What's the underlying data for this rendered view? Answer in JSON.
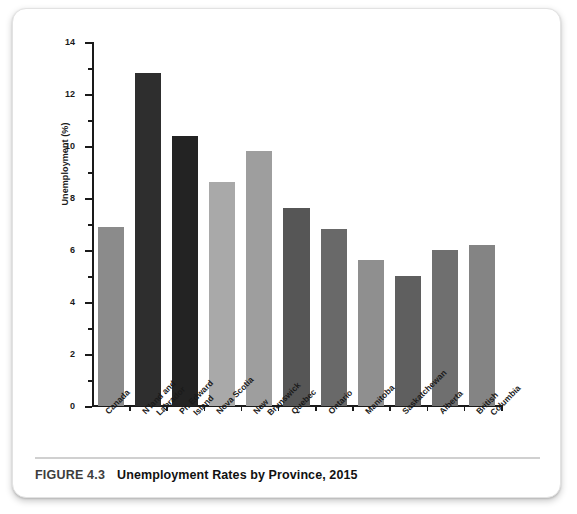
{
  "figure": {
    "caption_number": "FIGURE 4.3",
    "caption_title": "Unemployment Rates by Province, 2015"
  },
  "chart_data": {
    "type": "bar",
    "title": "Unemployment Rates by Province, 2015",
    "xlabel": "",
    "ylabel": "Unemployment (%)",
    "ylim": [
      0,
      14
    ],
    "y_ticks_major": [
      "0",
      "2",
      "4",
      "6",
      "8",
      "10",
      "12",
      "14"
    ],
    "y_ticks_minor": [
      1,
      3,
      5,
      7,
      9,
      11,
      13
    ],
    "grid": false,
    "legend": "none",
    "categories": [
      "Canada",
      "N'land and Labrador",
      "Pr. Edward Island",
      "Nova Scotia",
      "New Brunswick",
      "Quebec",
      "Ontario",
      "Manitoba",
      "Saskatchewan",
      "Alberta",
      "British Columbia"
    ],
    "category_lines": [
      [
        "Canada"
      ],
      [
        "N'land and",
        "Labrador"
      ],
      [
        "Pr. Edward",
        "Island"
      ],
      [
        "Nova Scotia"
      ],
      [
        "New",
        "Brunswick"
      ],
      [
        "Quebec"
      ],
      [
        "Ontario"
      ],
      [
        "Manitoba"
      ],
      [
        "Saskatchewan"
      ],
      [
        "Alberta"
      ],
      [
        "British",
        "Columbia"
      ]
    ],
    "values": [
      6.9,
      12.8,
      10.4,
      8.6,
      9.8,
      7.6,
      6.8,
      5.6,
      5.0,
      6.0,
      6.2
    ],
    "bar_colors": [
      "#8b8b8b",
      "#2e2e2e",
      "#232323",
      "#a9a9a9",
      "#9e9e9e",
      "#565656",
      "#696969",
      "#8f8f8f",
      "#5f5f5f",
      "#6f6f6f",
      "#848484"
    ]
  },
  "colors": {
    "axis": "#1a1a1a",
    "card_border": "#e2e2e2",
    "caption_rule": "#d0d0d0",
    "caption_number": "#3d3d3d",
    "caption_title": "#111111"
  }
}
